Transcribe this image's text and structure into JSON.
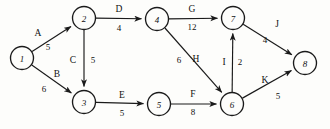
{
  "diagram": {
    "type": "directed-weighted-graph",
    "width": 330,
    "height": 129,
    "background_color": "#fdfdfb",
    "stroke_color": "#1a1a1a",
    "node_radius": 11.5,
    "nodes": [
      {
        "id": "1",
        "label": "1",
        "x": 22,
        "y": 58
      },
      {
        "id": "2",
        "label": "2",
        "x": 84,
        "y": 18
      },
      {
        "id": "3",
        "label": "3",
        "x": 84,
        "y": 102
      },
      {
        "id": "4",
        "label": "4",
        "x": 157,
        "y": 19
      },
      {
        "id": "5",
        "label": "5",
        "x": 159,
        "y": 104
      },
      {
        "id": "6",
        "label": "6",
        "x": 232,
        "y": 104
      },
      {
        "id": "7",
        "label": "7",
        "x": 233,
        "y": 18
      },
      {
        "id": "8",
        "label": "8",
        "x": 305,
        "y": 63
      }
    ],
    "edges": [
      {
        "name": "A",
        "weight": "5",
        "from": "1",
        "to": "2",
        "name_x": 38,
        "name_y": 33,
        "weight_x": 48,
        "weight_y": 47
      },
      {
        "name": "B",
        "weight": "6",
        "from": "1",
        "to": "3",
        "name_x": 57,
        "name_y": 74,
        "weight_x": 44,
        "weight_y": 89
      },
      {
        "name": "C",
        "weight": "5",
        "from": "2",
        "to": "3",
        "name_x": 73,
        "name_y": 60,
        "weight_x": 93,
        "weight_y": 60
      },
      {
        "name": "D",
        "weight": "4",
        "from": "2",
        "to": "4",
        "name_x": 119,
        "name_y": 9,
        "weight_x": 119,
        "weight_y": 28
      },
      {
        "name": "E",
        "weight": "5",
        "from": "3",
        "to": "5",
        "name_x": 122,
        "name_y": 95,
        "weight_x": 122,
        "weight_y": 113
      },
      {
        "name": "F",
        "weight": "8",
        "from": "5",
        "to": "6",
        "name_x": 193,
        "name_y": 94,
        "weight_x": 193,
        "weight_y": 112
      },
      {
        "name": "G",
        "weight": "12",
        "from": "4",
        "to": "7",
        "name_x": 192,
        "name_y": 9,
        "weight_x": 192,
        "weight_y": 27
      },
      {
        "name": "H",
        "weight": "6",
        "from": "4",
        "to": "6",
        "name_x": 196,
        "name_y": 59,
        "weight_x": 179,
        "weight_y": 60
      },
      {
        "name": "I",
        "weight": "2",
        "from": "6",
        "to": "7",
        "name_x": 224,
        "name_y": 62,
        "weight_x": 240,
        "weight_y": 62
      },
      {
        "name": "J",
        "weight": "4",
        "from": "7",
        "to": "8",
        "name_x": 277,
        "name_y": 24,
        "weight_x": 265,
        "weight_y": 40
      },
      {
        "name": "K",
        "weight": "5",
        "from": "6",
        "to": "8",
        "name_x": 265,
        "name_y": 80,
        "weight_x": 278,
        "weight_y": 96
      }
    ]
  }
}
